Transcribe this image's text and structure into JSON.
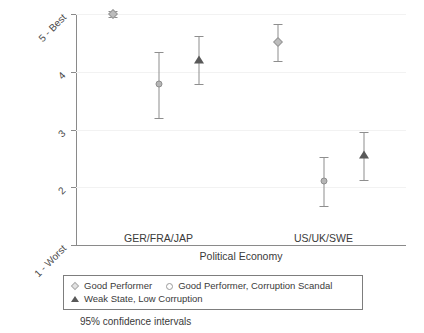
{
  "chart_data": {
    "type": "scatter",
    "title": "",
    "xlabel": "Political Economy",
    "ylabel": "Ranking of Government as Delivery Channel",
    "caption": "95% confidence intervals",
    "categories": [
      "GER/FRA/JAP",
      "US/UK/SWE"
    ],
    "ylim": [
      1,
      5
    ],
    "yticks": [
      {
        "value": 5,
        "label": "5 - Best"
      },
      {
        "value": 4,
        "label": "4"
      },
      {
        "value": 3,
        "label": "3"
      },
      {
        "value": 2,
        "label": "2"
      },
      {
        "value": 1,
        "label": "1 - Worst"
      }
    ],
    "grid": true,
    "legend_position": "below-axis",
    "series": [
      {
        "name": "Good Performer",
        "marker": "diamond",
        "color": "#bdbdbd",
        "points": [
          {
            "category": "GER/FRA/JAP",
            "value": 5.0,
            "ci_low": 4.94,
            "ci_high": 5.06
          },
          {
            "category": "US/UK/SWE",
            "value": 4.51,
            "ci_low": 4.19,
            "ci_high": 4.83
          }
        ]
      },
      {
        "name": "Good Performer, Corruption Scandal",
        "marker": "circle",
        "color": "#b5b5b5",
        "points": [
          {
            "category": "GER/FRA/JAP",
            "value": 3.78,
            "ci_low": 3.2,
            "ci_high": 4.35
          },
          {
            "category": "US/UK/SWE",
            "value": 2.11,
            "ci_low": 1.68,
            "ci_high": 2.53
          }
        ]
      },
      {
        "name": "Weak State, Low Corruption",
        "marker": "triangle",
        "color": "#595959",
        "points": [
          {
            "category": "GER/FRA/JAP",
            "value": 4.2,
            "ci_low": 3.78,
            "ci_high": 4.62
          },
          {
            "category": "US/UK/SWE",
            "value": 2.56,
            "ci_low": 2.13,
            "ci_high": 2.96
          }
        ]
      }
    ]
  },
  "legend": {
    "items": [
      {
        "label": "Good Performer",
        "marker": "diamond"
      },
      {
        "label": "Good Performer, Corruption Scandal",
        "marker": "circle"
      },
      {
        "label": "Weak State, Low Corruption",
        "marker": "triangle"
      }
    ]
  }
}
